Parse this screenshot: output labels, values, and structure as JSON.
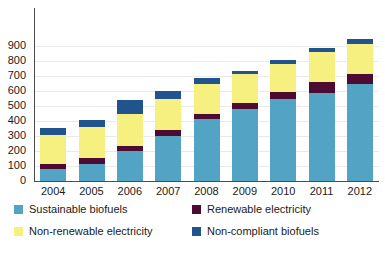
{
  "chart_data": {
    "type": "bar",
    "subtype": "stacked-bar",
    "title": "",
    "subtitle": "",
    "xlabel": "",
    "ylabel": "",
    "grid": true,
    "legend_position": "bottom",
    "categories": [
      "2004",
      "2005",
      "2006",
      "2007",
      "2008",
      "2009",
      "2010",
      "2011",
      "2012"
    ],
    "ylim": [
      0,
      900
    ],
    "yticks": [
      0,
      100,
      200,
      300,
      400,
      500,
      600,
      700,
      800,
      900
    ],
    "ytick_labels": [
      "0",
      "100",
      "200",
      "300",
      "400",
      "500",
      "600",
      "700",
      "800",
      "900"
    ],
    "series": [
      {
        "name": "Sustainable biofuels",
        "color": "#53a3c4",
        "values": [
          80,
          115,
          200,
          300,
          415,
          480,
          545,
          590,
          645
        ]
      },
      {
        "name": "Renewable electricity",
        "color": "#4e0b32",
        "values": [
          35,
          40,
          35,
          40,
          35,
          40,
          50,
          70,
          70
        ]
      },
      {
        "name": "Non-renewable electricity",
        "color": "#f6f080",
        "values": [
          195,
          205,
          210,
          210,
          200,
          195,
          185,
          200,
          200
        ]
      },
      {
        "name": "Non-compliant biofuels",
        "color": "#21548c",
        "values": [
          45,
          45,
          95,
          50,
          35,
          20,
          25,
          30,
          30
        ]
      }
    ],
    "totals": [
      355,
      405,
      540,
      600,
      685,
      735,
      805,
      890,
      945
    ]
  },
  "legend": {
    "items": [
      {
        "label": "Sustainable biofuels",
        "color": "#53a3c4"
      },
      {
        "label": "Renewable electricity",
        "color": "#4e0b32"
      },
      {
        "label": "Non-renewable electricity",
        "color": "#f6f080"
      },
      {
        "label": "Non-compliant biofuels",
        "color": "#21548c"
      }
    ]
  },
  "colors": {
    "axis": "#4d4d4d",
    "grid": "#e9e9e9",
    "text": "#1a1a1a",
    "background": "#ffffff"
  }
}
